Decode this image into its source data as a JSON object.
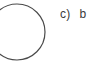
{
  "canvas": {
    "width": 95,
    "height": 62,
    "background_color": "#ffffff"
  },
  "figure": {
    "name": "circle-outline",
    "shape": "circle",
    "clipped_edge": "left",
    "stroke_color": "#4a4a4a",
    "stroke_width": 1.2,
    "fill": "none",
    "center_x": 17,
    "center_y": 32,
    "radius": 28
  },
  "answer_option": {
    "marker": "c)",
    "text": "b",
    "text_clipped_edge": "right",
    "color": "#3a3a3a"
  }
}
